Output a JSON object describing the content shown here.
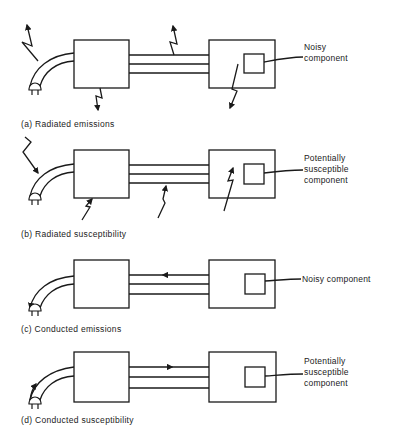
{
  "panels": [
    {
      "id": "a",
      "caption": "(a)  Radiated emissions",
      "label_lines": [
        "Noisy",
        "component"
      ],
      "coupling": "radiated",
      "direction": "outward"
    },
    {
      "id": "b",
      "caption": "(b)  Radiated susceptibility",
      "label_lines": [
        "Potentially",
        "susceptible",
        "component"
      ],
      "coupling": "radiated",
      "direction": "inward"
    },
    {
      "id": "c",
      "caption": "(c)  Conducted emissions",
      "label_lines": [
        "Noisy component"
      ],
      "coupling": "conducted",
      "direction": "outward"
    },
    {
      "id": "d",
      "caption": "(d)  Conducted susceptibility",
      "label_lines": [
        "Potentially",
        "susceptible",
        "component"
      ],
      "coupling": "conducted",
      "direction": "inward"
    }
  ],
  "colors": {
    "line": "#1a1a1a",
    "text": "#222222",
    "background": "#ffffff"
  }
}
